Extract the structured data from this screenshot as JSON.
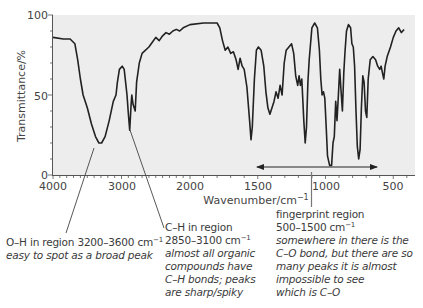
{
  "chart_data": {
    "type": "line",
    "title": "",
    "xlabel": "Wavenumber/cm⁻¹",
    "ylabel": "Transmittance/%",
    "xlim": [
      4000,
      400
    ],
    "ylim": [
      0,
      100
    ],
    "x_scale_note": "x-axis scale changes at 2000 cm-1 (expanded below 2000)",
    "x_ticks": [
      4000,
      3000,
      2000,
      1500,
      1000,
      500
    ],
    "y_ticks": [
      0,
      50,
      100
    ],
    "grid": false,
    "background": "#eeeeee",
    "line_color": "#222222",
    "series": [
      {
        "name": "IR spectrum",
        "points": [
          [
            4000,
            86
          ],
          [
            3850,
            85
          ],
          [
            3750,
            85
          ],
          [
            3680,
            82
          ],
          [
            3640,
            72
          ],
          [
            3600,
            60
          ],
          [
            3560,
            50
          ],
          [
            3500,
            42
          ],
          [
            3440,
            32
          ],
          [
            3380,
            24
          ],
          [
            3330,
            20
          ],
          [
            3290,
            20
          ],
          [
            3240,
            24
          ],
          [
            3180,
            34
          ],
          [
            3120,
            46
          ],
          [
            3080,
            50
          ],
          [
            3060,
            58
          ],
          [
            3030,
            66
          ],
          [
            2990,
            68
          ],
          [
            2960,
            66
          ],
          [
            2940,
            58
          ],
          [
            2920,
            50
          ],
          [
            2900,
            38
          ],
          [
            2880,
            28
          ],
          [
            2860,
            44
          ],
          [
            2850,
            50
          ],
          [
            2830,
            44
          ],
          [
            2800,
            40
          ],
          [
            2780,
            58
          ],
          [
            2740,
            70
          ],
          [
            2700,
            76
          ],
          [
            2600,
            80
          ],
          [
            2550,
            83
          ],
          [
            2500,
            86
          ],
          [
            2450,
            84
          ],
          [
            2400,
            87
          ],
          [
            2350,
            89
          ],
          [
            2300,
            88
          ],
          [
            2250,
            90
          ],
          [
            2200,
            91
          ],
          [
            2150,
            90
          ],
          [
            2100,
            92
          ],
          [
            2000,
            94
          ],
          [
            1900,
            95
          ],
          [
            1800,
            95
          ],
          [
            1780,
            92
          ],
          [
            1760,
            84
          ],
          [
            1740,
            78
          ],
          [
            1720,
            80
          ],
          [
            1700,
            76
          ],
          [
            1680,
            77
          ],
          [
            1660,
            72
          ],
          [
            1645,
            66
          ],
          [
            1630,
            73
          ],
          [
            1615,
            68
          ],
          [
            1600,
            66
          ],
          [
            1580,
            55
          ],
          [
            1560,
            34
          ],
          [
            1550,
            22
          ],
          [
            1540,
            30
          ],
          [
            1525,
            60
          ],
          [
            1510,
            78
          ],
          [
            1495,
            80
          ],
          [
            1475,
            78
          ],
          [
            1455,
            68
          ],
          [
            1440,
            52
          ],
          [
            1425,
            42
          ],
          [
            1410,
            38
          ],
          [
            1395,
            42
          ],
          [
            1380,
            46
          ],
          [
            1365,
            52
          ],
          [
            1350,
            48
          ],
          [
            1335,
            56
          ],
          [
            1320,
            50
          ],
          [
            1305,
            70
          ],
          [
            1290,
            78
          ],
          [
            1270,
            80
          ],
          [
            1250,
            82
          ],
          [
            1235,
            76
          ],
          [
            1220,
            62
          ],
          [
            1205,
            56
          ],
          [
            1195,
            62
          ],
          [
            1185,
            56
          ],
          [
            1175,
            60
          ],
          [
            1160,
            34
          ],
          [
            1150,
            20
          ],
          [
            1140,
            30
          ],
          [
            1130,
            58
          ],
          [
            1120,
            72
          ],
          [
            1100,
            92
          ],
          [
            1080,
            95
          ],
          [
            1060,
            92
          ],
          [
            1045,
            78
          ],
          [
            1035,
            60
          ],
          [
            1025,
            50
          ],
          [
            1015,
            52
          ],
          [
            1005,
            48
          ],
          [
            995,
            30
          ],
          [
            985,
            12
          ],
          [
            970,
            6
          ],
          [
            955,
            6
          ],
          [
            945,
            20
          ],
          [
            935,
            24
          ],
          [
            925,
            46
          ],
          [
            915,
            34
          ],
          [
            905,
            50
          ],
          [
            895,
            66
          ],
          [
            885,
            52
          ],
          [
            875,
            40
          ],
          [
            865,
            64
          ],
          [
            855,
            78
          ],
          [
            845,
            90
          ],
          [
            830,
            94
          ],
          [
            815,
            92
          ],
          [
            805,
            82
          ],
          [
            795,
            80
          ],
          [
            785,
            68
          ],
          [
            775,
            40
          ],
          [
            765,
            18
          ],
          [
            755,
            10
          ],
          [
            745,
            16
          ],
          [
            735,
            42
          ],
          [
            725,
            62
          ],
          [
            715,
            58
          ],
          [
            705,
            40
          ],
          [
            695,
            36
          ],
          [
            685,
            60
          ],
          [
            670,
            72
          ],
          [
            650,
            74
          ],
          [
            630,
            72
          ],
          [
            615,
            68
          ],
          [
            600,
            66
          ],
          [
            590,
            68
          ],
          [
            580,
            64
          ],
          [
            570,
            60
          ],
          [
            560,
            68
          ],
          [
            545,
            74
          ],
          [
            520,
            80
          ],
          [
            500,
            86
          ],
          [
            480,
            90
          ],
          [
            460,
            92
          ],
          [
            440,
            89
          ],
          [
            420,
            91
          ]
        ]
      }
    ],
    "annotations": [
      {
        "text": "fingerprint region double arrow",
        "from": 1500,
        "to": 600,
        "y": 5
      }
    ]
  },
  "axes": {
    "y_label": "Transmittance/%",
    "x_label_main": "Wavenumber/cm",
    "x_label_sup": "−1",
    "y_ticks": [
      "100",
      "50",
      "0"
    ],
    "x_ticks": [
      "4000",
      "3000",
      "2000",
      "1500",
      "1000",
      "500"
    ]
  },
  "annotations": {
    "oh": {
      "line1_main": "O–H in region 3200–3600 cm",
      "line1_sup": "−1",
      "line2": "easy to spot as a broad peak"
    },
    "ch": {
      "line1": "C–H in region",
      "line2_main": "2850–3100 cm",
      "line2_sup": "−1",
      "line3": "almost all organic",
      "line4": "compounds have",
      "line5": "C–H bonds; peaks",
      "line6": "are sharp/spiky"
    },
    "fingerprint": {
      "line1": "fingerprint region",
      "line2_main": "500–1500 cm",
      "line2_sup": "−1",
      "line3": "somewhere in there is the",
      "line4": "C–O bond, but there are so",
      "line5": "many peaks it is almost",
      "line6": "impossible to see",
      "line7": "which is C–O"
    }
  }
}
